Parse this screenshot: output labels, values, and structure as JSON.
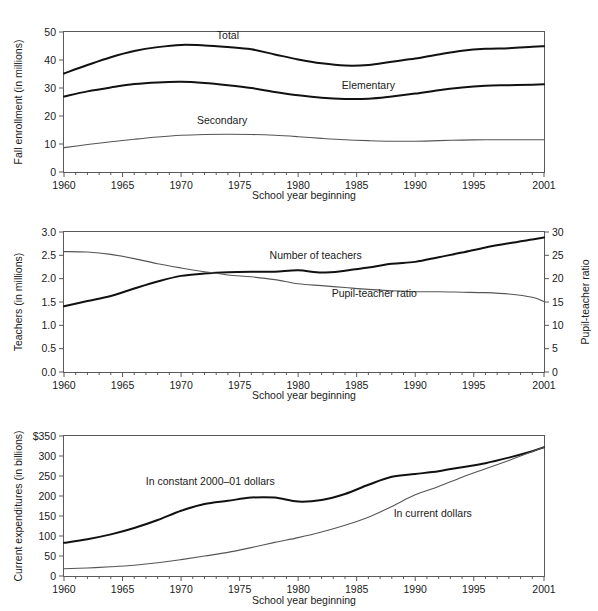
{
  "page": {
    "background": "#ffffff",
    "panel_count": 3
  },
  "colors": {
    "thick_line": "#111111",
    "thin_line": "#555555",
    "axis": "#5a5a5a",
    "text": "#1a1a1a"
  },
  "chart_data": [
    {
      "id": "enrollment",
      "type": "line",
      "title": "",
      "xlabel": "School year beginning",
      "ylabel": "Fall enrollment (in millions)",
      "xlim": [
        1960,
        2001
      ],
      "ylim": [
        0,
        50
      ],
      "xticks": [
        1960,
        1965,
        1970,
        1975,
        1980,
        1985,
        1990,
        1995,
        2001
      ],
      "xticklabels": [
        "1960",
        "1965",
        "1970",
        "1975",
        "1980",
        "1985",
        "1990",
        "1995",
        "2001"
      ],
      "yticks": [
        0,
        10,
        20,
        30,
        40,
        50
      ],
      "yticklabels": [
        "0",
        "10",
        "20",
        "30",
        "40",
        "50"
      ],
      "minor_xtick_interval": 1,
      "grid": false,
      "legend": "inline-labels",
      "x": [
        1960,
        1962,
        1964,
        1966,
        1968,
        1970,
        1972,
        1974,
        1976,
        1978,
        1980,
        1982,
        1984,
        1986,
        1988,
        1990,
        1992,
        1994,
        1996,
        1998,
        2000,
        2001
      ],
      "series": [
        {
          "name": "Total",
          "label": "Total",
          "style": "thick",
          "label_x": 1974.0,
          "label_y": 47.6,
          "values": [
            35.2,
            38.2,
            41.0,
            43.2,
            44.6,
            45.4,
            45.2,
            44.6,
            43.8,
            42.0,
            40.2,
            38.8,
            38.0,
            38.2,
            39.4,
            40.5,
            42.0,
            43.3,
            44.0,
            44.2,
            44.7,
            44.9
          ]
        },
        {
          "name": "Elementary",
          "label": "Elementary",
          "style": "thick",
          "label_x": 1986.0,
          "label_y": 29.5,
          "values": [
            27.0,
            28.8,
            30.2,
            31.4,
            32.0,
            32.2,
            31.8,
            31.0,
            30.0,
            28.6,
            27.4,
            26.5,
            26.1,
            26.2,
            27.0,
            28.0,
            29.2,
            30.2,
            30.8,
            31.0,
            31.2,
            31.3
          ]
        },
        {
          "name": "Secondary",
          "label": "Secondary",
          "style": "thin",
          "label_x": 1973.5,
          "label_y": 17.0,
          "values": [
            8.7,
            9.8,
            10.8,
            11.7,
            12.5,
            13.1,
            13.4,
            13.5,
            13.4,
            13.1,
            12.6,
            12.0,
            11.5,
            11.2,
            11.0,
            11.0,
            11.2,
            11.4,
            11.5,
            11.5,
            11.5,
            11.5
          ]
        }
      ]
    },
    {
      "id": "teachers",
      "type": "line",
      "title": "",
      "xlabel": "School year beginning",
      "ylabel": "Teachers (in millions)",
      "ylabel_right": "Pupil-teacher ratio",
      "xlim": [
        1960,
        2001
      ],
      "ylim": [
        0.0,
        3.0
      ],
      "ylim_right": [
        0,
        30
      ],
      "xticks": [
        1960,
        1965,
        1970,
        1975,
        1980,
        1985,
        1990,
        1995,
        2001
      ],
      "xticklabels": [
        "1960",
        "1965",
        "1970",
        "1975",
        "1980",
        "1985",
        "1990",
        "1995",
        "2001"
      ],
      "yticks": [
        0.0,
        0.5,
        1.0,
        1.5,
        2.0,
        2.5,
        3.0
      ],
      "yticklabels": [
        "0.0",
        "0.5",
        "1.0",
        "1.5",
        "2.0",
        "2.5",
        "3.0"
      ],
      "yticks_right": [
        0,
        5,
        10,
        15,
        20,
        25,
        30
      ],
      "yticklabels_right": [
        "0",
        "5",
        "10",
        "15",
        "20",
        "25",
        "30"
      ],
      "minor_xtick_interval": 1,
      "grid": false,
      "legend": "inline-labels",
      "x": [
        1960,
        1962,
        1964,
        1966,
        1968,
        1970,
        1972,
        1974,
        1976,
        1978,
        1980,
        1982,
        1984,
        1986,
        1988,
        1990,
        1992,
        1994,
        1996,
        1998,
        2000,
        2001
      ],
      "series": [
        {
          "name": "Number of teachers",
          "label": "Number of teachers",
          "style": "thick",
          "axis": "left",
          "units": "millions",
          "label_x": 1981.5,
          "label_y": 2.42,
          "values": [
            1.41,
            1.52,
            1.63,
            1.79,
            1.94,
            2.06,
            2.11,
            2.14,
            2.15,
            2.15,
            2.18,
            2.13,
            2.17,
            2.24,
            2.32,
            2.36,
            2.46,
            2.56,
            2.67,
            2.76,
            2.84,
            2.88
          ]
        },
        {
          "name": "Pupil-teacher ratio",
          "label": "Pupil-teacher ratio",
          "style": "thin",
          "axis": "right",
          "units": "pupils per teacher",
          "label_x": 1986.5,
          "label_y": 16.0,
          "values": [
            25.8,
            25.7,
            25.2,
            24.3,
            23.2,
            22.3,
            21.5,
            20.8,
            20.4,
            19.8,
            18.9,
            18.5,
            18.1,
            17.7,
            17.4,
            17.2,
            17.2,
            17.1,
            17.0,
            16.7,
            16.0,
            15.1
          ]
        }
      ]
    },
    {
      "id": "expenditures",
      "type": "line",
      "title": "",
      "xlabel": "School year beginning",
      "ylabel": "Current expenditures (in billions)",
      "xlim": [
        1960,
        2001
      ],
      "ylim": [
        0,
        350
      ],
      "xticks": [
        1960,
        1965,
        1970,
        1975,
        1980,
        1985,
        1990,
        1995,
        2001
      ],
      "xticklabels": [
        "1960",
        "1965",
        "1970",
        "1975",
        "1980",
        "1985",
        "1990",
        "1995",
        "2001"
      ],
      "yticks": [
        0,
        50,
        100,
        150,
        200,
        250,
        300,
        350
      ],
      "yticklabels": [
        "0",
        "50",
        "100",
        "150",
        "200",
        "250",
        "300",
        "$350"
      ],
      "minor_xtick_interval": 1,
      "grid": false,
      "legend": "inline-labels",
      "x": [
        1960,
        1962,
        1964,
        1966,
        1968,
        1970,
        1972,
        1974,
        1976,
        1978,
        1980,
        1982,
        1984,
        1986,
        1988,
        1990,
        1992,
        1994,
        1996,
        1998,
        2000,
        2001
      ],
      "series": [
        {
          "name": "In constant 2000-01 dollars",
          "label": "In constant 2000–01 dollars",
          "style": "thick",
          "label_x": 1972.5,
          "label_y": 228,
          "values": [
            83,
            92,
            104,
            120,
            140,
            163,
            180,
            188,
            196,
            196,
            186,
            190,
            205,
            228,
            248,
            255,
            262,
            272,
            282,
            296,
            312,
            322
          ]
        },
        {
          "name": "In current dollars",
          "label": "In current dollars",
          "style": "thin",
          "label_x": 1991.5,
          "label_y": 148,
          "values": [
            18,
            20,
            23,
            27,
            33,
            41,
            50,
            59,
            71,
            84,
            96,
            110,
            127,
            147,
            174,
            203,
            224,
            247,
            268,
            289,
            311,
            322
          ]
        }
      ]
    }
  ]
}
